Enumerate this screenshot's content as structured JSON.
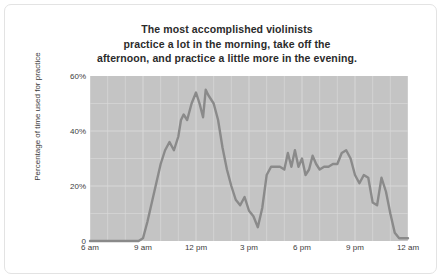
{
  "chart_data": {
    "type": "line",
    "title": "The most accomplished violinists practice a lot in the morning, take off the afternoon, and practice a little more in the evening.",
    "title_lines": [
      "The most accomplished violinists",
      "practice a lot in the morning, take off the",
      "afternoon, and practice a little more in the evening."
    ],
    "xlabel": "",
    "ylabel": "Percentage of time used for practice",
    "xlim": [
      6,
      24
    ],
    "ylim": [
      0,
      60
    ],
    "grid": true,
    "legend": null,
    "line_color": "#8a8a8a",
    "plot_background": "#c4c4c4",
    "gridline_color": "#d8d8d8",
    "y_ticks": [
      {
        "value": 0,
        "label": "0"
      },
      {
        "value": 20,
        "label": "20%"
      },
      {
        "value": 40,
        "label": "40%"
      },
      {
        "value": 60,
        "label": "60%"
      }
    ],
    "x_ticks": [
      {
        "value": 6,
        "label": "6 am"
      },
      {
        "value": 9,
        "label": "9 am"
      },
      {
        "value": 12,
        "label": "12 pm"
      },
      {
        "value": 15,
        "label": "3 pm"
      },
      {
        "value": 18,
        "label": "6 pm"
      },
      {
        "value": 21,
        "label": "9 pm"
      },
      {
        "value": 24,
        "label": "12 am"
      }
    ],
    "x": [
      6,
      6.5,
      7,
      7.5,
      8,
      8.5,
      8.75,
      9,
      9.25,
      9.5,
      9.75,
      10,
      10.25,
      10.5,
      10.75,
      11,
      11.15,
      11.3,
      11.5,
      11.75,
      12,
      12.2,
      12.4,
      12.55,
      12.7,
      13,
      13.25,
      13.5,
      13.75,
      14,
      14.25,
      14.5,
      14.75,
      15,
      15.25,
      15.5,
      15.75,
      16,
      16.25,
      16.5,
      16.75,
      17,
      17.2,
      17.4,
      17.6,
      17.8,
      18,
      18.2,
      18.4,
      18.6,
      18.8,
      19,
      19.25,
      19.5,
      19.75,
      20,
      20.25,
      20.5,
      20.75,
      21,
      21.25,
      21.5,
      21.75,
      22,
      22.25,
      22.5,
      22.75,
      23,
      23.25,
      23.5,
      24
    ],
    "values": [
      0,
      0,
      0,
      0,
      0,
      0,
      0,
      1,
      7,
      14,
      21,
      28,
      33,
      36,
      33,
      38,
      44,
      46,
      44,
      50,
      54,
      50,
      45,
      55,
      53,
      50,
      44,
      34,
      26,
      20,
      15,
      13,
      16,
      11,
      9,
      5,
      12,
      24,
      27,
      27,
      27,
      26,
      32,
      27,
      33,
      27,
      30,
      24,
      26,
      31,
      28,
      26,
      27,
      27,
      28,
      28,
      32,
      33,
      30,
      24,
      21,
      24,
      23,
      14,
      13,
      23,
      18,
      10,
      3,
      1,
      1
    ]
  }
}
